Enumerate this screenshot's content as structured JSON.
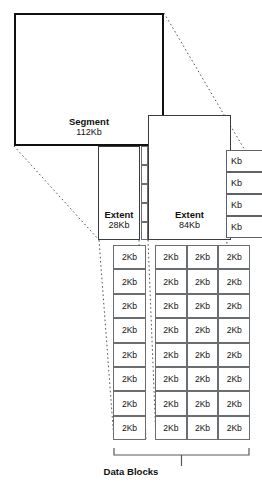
{
  "diagram": {
    "segment": {
      "name": "Segment",
      "size": "112Kb"
    },
    "extents": [
      {
        "name": "Extent",
        "size": "28Kb"
      },
      {
        "name": "Extent",
        "size": "84Kb"
      }
    ],
    "right_clipped_blocks": [
      {
        "label": "Kb"
      },
      {
        "label": "Kb"
      },
      {
        "label": "Kb"
      },
      {
        "label": "Kb"
      }
    ],
    "left_block_column": [
      "2Kb",
      "2Kb",
      "2Kb",
      "2Kb",
      "2Kb",
      "2Kb",
      "2Kb",
      "2Kb"
    ],
    "right_block_grid": [
      [
        "2Kb",
        "2Kb",
        "2Kb"
      ],
      [
        "2Kb",
        "2Kb",
        "2Kb"
      ],
      [
        "2Kb",
        "2Kb",
        "2Kb"
      ],
      [
        "2Kb",
        "2Kb",
        "2Kb"
      ],
      [
        "2Kb",
        "2Kb",
        "2Kb"
      ],
      [
        "2Kb",
        "2Kb",
        "2Kb"
      ],
      [
        "2Kb",
        "2Kb",
        "2Kb"
      ],
      [
        "2Kb",
        "2Kb",
        "2Kb"
      ]
    ],
    "caption": "Data Blocks",
    "colors": {
      "stroke_strong": "#101010",
      "stroke_medium": "#3a3d40",
      "stroke_light": "#6a6e71",
      "connector": "#555555",
      "background": "#ffffff",
      "text": "#111111"
    }
  }
}
